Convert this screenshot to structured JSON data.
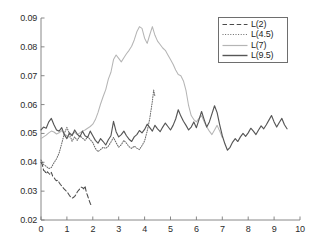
{
  "chart_data": {
    "type": "line",
    "title": "",
    "xlabel": "",
    "ylabel": "",
    "xlim": [
      0,
      10
    ],
    "ylim": [
      0.02,
      0.09
    ],
    "grid": false,
    "legend_position": "top-right",
    "xticks": [
      "0",
      "1",
      "2",
      "3",
      "4",
      "5",
      "6",
      "7",
      "8",
      "9",
      "10"
    ],
    "yticks": [
      "0.02",
      "0.03",
      "0.04",
      "0.05",
      "0.06",
      "0.07",
      "0.08",
      "0.09"
    ],
    "series": [
      {
        "name": "L(2)",
        "style": "dashed",
        "color": "#4a4a4a",
        "x": [
          0.0,
          0.05,
          0.1,
          0.15,
          0.2,
          0.25,
          0.3,
          0.35,
          0.4,
          0.45,
          0.5,
          0.55,
          0.6,
          0.65,
          0.7,
          0.75,
          0.8,
          0.85,
          0.9,
          0.95,
          1.0,
          1.05,
          1.1,
          1.15,
          1.2,
          1.25,
          1.3,
          1.35,
          1.4,
          1.45,
          1.5,
          1.55,
          1.6,
          1.65,
          1.7,
          1.75,
          1.8,
          1.85,
          1.9,
          1.95
        ],
        "values": [
          0.04,
          0.0392,
          0.0372,
          0.0369,
          0.036,
          0.0367,
          0.0362,
          0.0357,
          0.0365,
          0.0352,
          0.0348,
          0.034,
          0.0336,
          0.0338,
          0.033,
          0.0323,
          0.0318,
          0.0312,
          0.0307,
          0.0303,
          0.0297,
          0.0292,
          0.0285,
          0.0279,
          0.0276,
          0.0278,
          0.0282,
          0.0288,
          0.0297,
          0.0303,
          0.0308,
          0.0314,
          0.0312,
          0.0308,
          0.0318,
          0.0296,
          0.0284,
          0.027,
          0.0258,
          0.0248
        ]
      },
      {
        "name": "L(4.5)",
        "style": "dotted",
        "color": "#6b6b6b",
        "x": [
          0.0,
          0.1,
          0.2,
          0.3,
          0.4,
          0.5,
          0.6,
          0.7,
          0.8,
          0.9,
          1.0,
          1.1,
          1.2,
          1.3,
          1.4,
          1.5,
          1.6,
          1.7,
          1.8,
          1.9,
          2.0,
          2.1,
          2.2,
          2.3,
          2.4,
          2.5,
          2.6,
          2.7,
          2.8,
          2.9,
          3.0,
          3.1,
          3.2,
          3.3,
          3.4,
          3.5,
          3.6,
          3.7,
          3.8,
          3.9,
          4.0,
          4.1,
          4.2,
          4.3,
          4.35,
          4.4
        ],
        "values": [
          0.0408,
          0.0392,
          0.0386,
          0.0378,
          0.0382,
          0.0398,
          0.0412,
          0.0432,
          0.0465,
          0.05,
          0.0521,
          0.0498,
          0.0473,
          0.0488,
          0.0476,
          0.0492,
          0.0484,
          0.0476,
          0.0488,
          0.0479,
          0.0468,
          0.0448,
          0.0437,
          0.0444,
          0.0452,
          0.0448,
          0.0456,
          0.047,
          0.0486,
          0.0468,
          0.0452,
          0.0461,
          0.0476,
          0.0466,
          0.0454,
          0.0448,
          0.0456,
          0.0449,
          0.0444,
          0.0458,
          0.0474,
          0.0508,
          0.0552,
          0.0611,
          0.065,
          0.0628
        ]
      },
      {
        "name": "L(7)",
        "style": "solid",
        "color": "#b5b5b5",
        "x": [
          0.0,
          0.1,
          0.2,
          0.3,
          0.4,
          0.5,
          0.6,
          0.7,
          0.8,
          0.9,
          1.0,
          1.1,
          1.2,
          1.3,
          1.4,
          1.5,
          1.6,
          1.7,
          1.8,
          1.9,
          2.0,
          2.1,
          2.2,
          2.3,
          2.4,
          2.5,
          2.6,
          2.7,
          2.8,
          2.9,
          3.0,
          3.1,
          3.2,
          3.3,
          3.4,
          3.5,
          3.6,
          3.7,
          3.8,
          3.9,
          4.0,
          4.1,
          4.2,
          4.3,
          4.4,
          4.5,
          4.6,
          4.7,
          4.8,
          4.9,
          5.0,
          5.1,
          5.2,
          5.3,
          5.4,
          5.5,
          5.6,
          5.7,
          5.8,
          5.9,
          6.0,
          6.1,
          6.2,
          6.3,
          6.4,
          6.5,
          6.6,
          6.7,
          6.8,
          6.9,
          7.0
        ],
        "values": [
          0.0482,
          0.0488,
          0.0494,
          0.0502,
          0.0508,
          0.0505,
          0.0498,
          0.0502,
          0.051,
          0.0498,
          0.0492,
          0.0487,
          0.0498,
          0.0504,
          0.0496,
          0.0502,
          0.0508,
          0.0512,
          0.0518,
          0.0524,
          0.0532,
          0.0548,
          0.0572,
          0.0602,
          0.0628,
          0.0652,
          0.0688,
          0.0712,
          0.0756,
          0.0772,
          0.076,
          0.0748,
          0.0762,
          0.0776,
          0.0788,
          0.0802,
          0.0824,
          0.0852,
          0.087,
          0.0864,
          0.083,
          0.0812,
          0.0842,
          0.087,
          0.084,
          0.082,
          0.0808,
          0.0796,
          0.0788,
          0.0772,
          0.0756,
          0.074,
          0.072,
          0.0704,
          0.07,
          0.0682,
          0.0648,
          0.0596,
          0.0562,
          0.0548,
          0.054,
          0.0552,
          0.0562,
          0.054,
          0.0522,
          0.0508,
          0.0496,
          0.0512,
          0.0528,
          0.0508,
          0.0486
        ]
      },
      {
        "name": "L(9.5)",
        "style": "solid",
        "color": "#565656",
        "x": [
          0.0,
          0.1,
          0.2,
          0.3,
          0.4,
          0.5,
          0.6,
          0.7,
          0.8,
          0.9,
          1.0,
          1.1,
          1.2,
          1.3,
          1.4,
          1.5,
          1.6,
          1.7,
          1.8,
          1.9,
          2.0,
          2.1,
          2.2,
          2.3,
          2.4,
          2.5,
          2.6,
          2.7,
          2.8,
          2.9,
          3.0,
          3.1,
          3.2,
          3.3,
          3.4,
          3.5,
          3.6,
          3.7,
          3.8,
          3.9,
          4.0,
          4.1,
          4.2,
          4.3,
          4.4,
          4.5,
          4.6,
          4.7,
          4.8,
          4.9,
          5.0,
          5.1,
          5.2,
          5.3,
          5.4,
          5.5,
          5.6,
          5.7,
          5.8,
          5.9,
          6.0,
          6.1,
          6.2,
          6.3,
          6.4,
          6.5,
          6.6,
          6.7,
          6.8,
          6.9,
          7.0,
          7.1,
          7.2,
          7.3,
          7.4,
          7.5,
          7.6,
          7.7,
          7.8,
          7.9,
          8.0,
          8.1,
          8.2,
          8.3,
          8.4,
          8.5,
          8.6,
          8.7,
          8.8,
          8.9,
          9.0,
          9.1,
          9.2,
          9.3,
          9.4,
          9.5
        ],
        "values": [
          0.0512,
          0.0522,
          0.0518,
          0.054,
          0.0552,
          0.053,
          0.0512,
          0.0508,
          0.052,
          0.0496,
          0.0482,
          0.0502,
          0.0492,
          0.0512,
          0.0498,
          0.0488,
          0.0508,
          0.0492,
          0.0486,
          0.0508,
          0.0492,
          0.0476,
          0.0466,
          0.0482,
          0.0472,
          0.046,
          0.0478,
          0.0492,
          0.0542,
          0.0506,
          0.0488,
          0.0496,
          0.0508,
          0.0492,
          0.048,
          0.0472,
          0.0488,
          0.0496,
          0.051,
          0.0502,
          0.0514,
          0.0532,
          0.052,
          0.0508,
          0.0528,
          0.0516,
          0.0506,
          0.0522,
          0.0536,
          0.0524,
          0.0512,
          0.0528,
          0.055,
          0.0582,
          0.056,
          0.0542,
          0.0528,
          0.0512,
          0.0522,
          0.054,
          0.052,
          0.0548,
          0.0576,
          0.0548,
          0.0522,
          0.054,
          0.0568,
          0.0596,
          0.0572,
          0.053,
          0.0492,
          0.0464,
          0.0442,
          0.0452,
          0.047,
          0.0482,
          0.0472,
          0.0488,
          0.05,
          0.049,
          0.0502,
          0.0518,
          0.0508,
          0.0496,
          0.0512,
          0.0526,
          0.0516,
          0.053,
          0.0546,
          0.0562,
          0.054,
          0.0522,
          0.0538,
          0.0552,
          0.053,
          0.0516
        ]
      }
    ]
  },
  "legend": {
    "items": [
      {
        "label": "L(2)"
      },
      {
        "label": "L(4.5)"
      },
      {
        "label": "L(7)"
      },
      {
        "label": "L(9.5)"
      }
    ]
  },
  "axes": {
    "color": "#7a7a7a"
  }
}
